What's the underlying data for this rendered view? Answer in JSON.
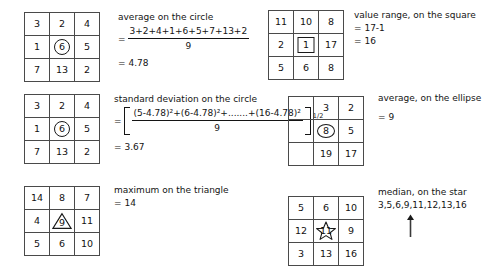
{
  "document": {
    "title": "Descriptive statistics on a 3x3 number grid — worked examples",
    "background_color": "#ffffff",
    "ink_color": "#141414"
  },
  "panels": [
    {
      "id": "average-circle",
      "marker": "circle",
      "grid": {
        "rows": [
          [
            "3",
            "2",
            "4"
          ],
          [
            "1",
            "6",
            "5"
          ],
          [
            "7",
            "13",
            "2"
          ]
        ],
        "marked_cell": {
          "row": 1,
          "col": 1,
          "value": "6"
        }
      },
      "note": {
        "heading": "average on the circle",
        "eq_sign": "=",
        "numerator": "3+2+4+1+6+5+7+13+2",
        "denominator": "9",
        "result": "= 4.78"
      }
    },
    {
      "id": "range-square",
      "marker": "square",
      "grid": {
        "rows": [
          [
            "11",
            "10",
            "8"
          ],
          [
            "2",
            "1",
            "17"
          ],
          [
            "5",
            "6",
            "8"
          ]
        ],
        "marked_cell": {
          "row": 1,
          "col": 1,
          "value": "1"
        }
      },
      "note": {
        "heading": "value range, on the square",
        "line2": "= 17-1",
        "result": "= 16"
      }
    },
    {
      "id": "stddev-circle",
      "marker": "circle",
      "grid": {
        "rows": [
          [
            "3",
            "2",
            "4"
          ],
          [
            "1",
            "6",
            "5"
          ],
          [
            "7",
            "13",
            "2"
          ]
        ],
        "marked_cell": {
          "row": 1,
          "col": 1,
          "value": "6"
        }
      },
      "note": {
        "heading": "standard deviation on the circle",
        "eq_sign": "=",
        "numerator": "(5-4.78)²+(6-4.78)²+.......+(16-4.78)²",
        "denominator": "9",
        "exponent": "1/2",
        "result": "= 3.67"
      }
    },
    {
      "id": "average-ellipse",
      "marker": "ellipse",
      "grid": {
        "rows": [
          [
            "",
            "3",
            "2"
          ],
          [
            "",
            "8",
            "5"
          ],
          [
            "",
            "19",
            "17"
          ]
        ],
        "marked_cell": {
          "row": 1,
          "col": 1,
          "value": "8"
        }
      },
      "note": {
        "heading": "average, on the ellipse",
        "result": "= 9"
      }
    },
    {
      "id": "maximum-triangle",
      "marker": "triangle",
      "grid": {
        "rows": [
          [
            "14",
            "8",
            "7"
          ],
          [
            "4",
            "9",
            "11"
          ],
          [
            "5",
            "6",
            "10"
          ]
        ],
        "marked_cell": {
          "row": 1,
          "col": 1,
          "value": "9"
        }
      },
      "note": {
        "heading": "maximum on the triangle",
        "result": "= 14"
      }
    },
    {
      "id": "median-star",
      "marker": "star",
      "grid": {
        "rows": [
          [
            "5",
            "6",
            "10"
          ],
          [
            "12",
            "11",
            "9"
          ],
          [
            "3",
            "13",
            "16"
          ]
        ],
        "marked_cell": {
          "row": 1,
          "col": 1,
          "value": "11"
        }
      },
      "note": {
        "heading": "median, on the star",
        "sorted_values": "3,5,6,9,11,12,13,16",
        "pointer_icon": "up-arrow"
      }
    }
  ]
}
